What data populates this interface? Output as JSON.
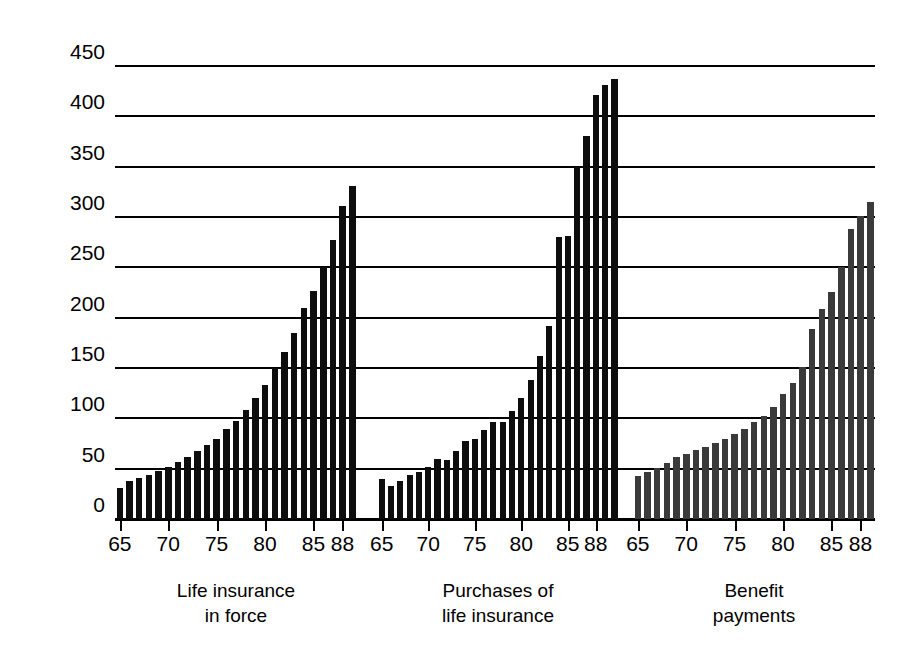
{
  "chart_data": {
    "type": "bar",
    "title": "",
    "subtitle": "",
    "xlabel": "",
    "ylabel": "Index: 1975 = 100",
    "ylim": [
      0,
      470
    ],
    "yticks": [
      0,
      50,
      100,
      150,
      200,
      250,
      300,
      350,
      400,
      450
    ],
    "ytick_labels": [
      "0",
      "50",
      "100",
      "150",
      "200",
      "250",
      "300",
      "350",
      "400",
      "450"
    ],
    "grid": true,
    "legend": "none",
    "x": [
      65,
      66,
      67,
      68,
      69,
      70,
      71,
      72,
      73,
      74,
      75,
      76,
      77,
      78,
      79,
      80,
      81,
      82,
      83,
      84,
      85,
      86,
      87,
      88
    ],
    "xtick_values": [
      65,
      70,
      75,
      80,
      85,
      88
    ],
    "xtick_labels": [
      "65",
      "70",
      "75",
      "80",
      "85",
      "88"
    ],
    "panels": [
      {
        "id": "life-insurance-in-force",
        "caption_line1": "Life insurance",
        "caption_line2": "in force",
        "color": "#0d0d0d",
        "series_name": "Life insurance in force",
        "values": [
          31,
          38,
          41,
          44,
          48,
          52,
          57,
          62,
          68,
          74,
          80,
          89,
          97,
          108,
          120,
          133,
          150,
          166,
          185,
          210,
          227,
          250,
          277,
          311,
          331
        ]
      },
      {
        "id": "purchases-of-life-insurance",
        "caption_line1": "Purchases of",
        "caption_line2": "life insurance",
        "color": "#0d0d0d",
        "series_name": "Purchases of life insurance",
        "values": [
          40,
          33,
          38,
          44,
          47,
          52,
          60,
          59,
          68,
          78,
          80,
          88,
          96,
          96,
          107,
          120,
          138,
          162,
          192,
          280,
          281,
          350,
          381,
          421,
          431,
          437
        ]
      },
      {
        "id": "benefit-payments",
        "caption_line1": "Benefit",
        "caption_line2": "payments",
        "color": "#3a3a3a",
        "series_name": "Benefit payments",
        "values": [
          43,
          47,
          51,
          56,
          62,
          65,
          69,
          72,
          76,
          80,
          84,
          89,
          96,
          102,
          111,
          124,
          135,
          151,
          189,
          209,
          226,
          250,
          288,
          301,
          315
        ]
      }
    ]
  },
  "axis": {
    "y_title": "Index: 1975 = 100"
  }
}
